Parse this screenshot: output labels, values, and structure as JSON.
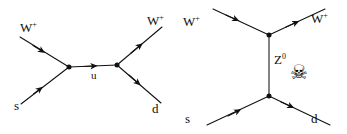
{
  "figure": {
    "name": "feynman-diagrams-w-boson-strange-to-down",
    "background_color": "#ffffff",
    "line_color": "#111111",
    "text_color": "#111111"
  },
  "diagrams": [
    {
      "id": "left-diagram",
      "channel": "s-channel",
      "propagator_label": "u",
      "labels": {
        "in_boson": "W",
        "in_boson_sup": "+",
        "in_quark": "s",
        "out_boson": "W",
        "out_boson_sup": "+",
        "out_quark": "d"
      }
    },
    {
      "id": "right-diagram",
      "channel": "t-channel",
      "propagator_label": "Z",
      "propagator_sup": "0",
      "labels": {
        "in_boson": "W",
        "in_boson_sup": "+",
        "in_quark": "s",
        "out_boson": "W",
        "out_boson_sup": "+",
        "out_quark": "d"
      },
      "annotation_icon": "skull-and-crossbones",
      "annotation_glyph": "☠"
    }
  ]
}
